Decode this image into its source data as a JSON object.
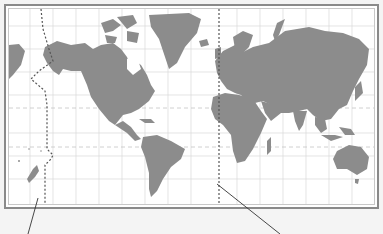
{
  "map": {
    "type": "world-map",
    "projection": "Mercator",
    "land_color": "#8c8c8c",
    "water_color": "#ffffff",
    "grid_color": "#d4d4d4",
    "frame_color": "#8a8a8a",
    "graticule": {
      "meridian_spacing_px": 23,
      "parallel_spacing_px": 23
    },
    "special_lines": [
      {
        "name": "prime-meridian",
        "style": "dotted",
        "color": "#555555"
      },
      {
        "name": "international-date-line",
        "style": "dotted",
        "color": "#555555"
      },
      {
        "name": "tropic-of-cancer",
        "style": "dashed",
        "color": "#c8c8c8"
      },
      {
        "name": "tropic-of-capricorn",
        "style": "dashed",
        "color": "#c8c8c8"
      }
    ],
    "callouts": [
      {
        "name": "date-line-leader",
        "label": ""
      },
      {
        "name": "prime-meridian-leader",
        "label": ""
      }
    ]
  }
}
